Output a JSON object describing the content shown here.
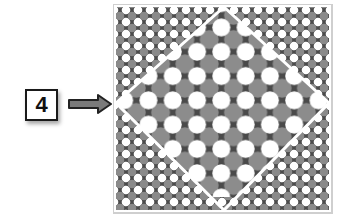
{
  "label": {
    "text": "4"
  },
  "arrow": {
    "direction": "right",
    "fill": "#7a7a7a",
    "stroke": "#222222"
  },
  "figure": {
    "frame_color": "#d8d8d8",
    "background": "#4a4a4a",
    "outer_grid": {
      "pitch": 12,
      "white_radius": 4.3,
      "gray_radius": 4.3,
      "white": "#ffffff",
      "gray": "#8a8a8a"
    },
    "inner_grid": {
      "pitch": 24.3,
      "white_radius": 9,
      "gray_radius": 9.5,
      "white": "#ffffff",
      "gray": "#8c8c8c"
    },
    "diamond_line_color": "#ffffff"
  }
}
